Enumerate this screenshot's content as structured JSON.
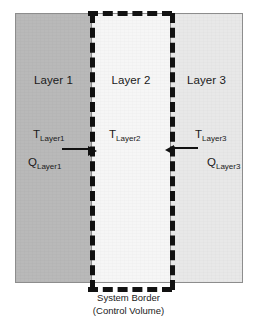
{
  "figure": {
    "name": "three-layer-wall-control-volume-diagram",
    "caption": {
      "line1": "System Border",
      "line2": "(Control Volume)"
    },
    "colors": {
      "layer1_fill": "#b9b9b9",
      "layer2_fill": "#f6f6f6",
      "layer3_fill": "#e8e8e8",
      "outline": "#8d8d8d",
      "control_volume_border": "#111111",
      "arrow": "#111111",
      "text": "#1a1a1a",
      "background": "#ffffff"
    },
    "layers": [
      {
        "title": "Layer 1",
        "temperature_symbol": "T",
        "temperature_subscript": "Layer1",
        "heat_symbol": "Q",
        "heat_subscript": "Layer1",
        "heat_flow_direction": "right"
      },
      {
        "title": "Layer 2",
        "temperature_symbol": "T",
        "temperature_subscript": "Layer2",
        "heat_symbol": "",
        "heat_subscript": "",
        "heat_flow_direction": "none"
      },
      {
        "title": "Layer 3",
        "temperature_symbol": "T",
        "temperature_subscript": "Layer3",
        "heat_symbol": "Q",
        "heat_subscript": "Layer3",
        "heat_flow_direction": "left"
      }
    ]
  }
}
